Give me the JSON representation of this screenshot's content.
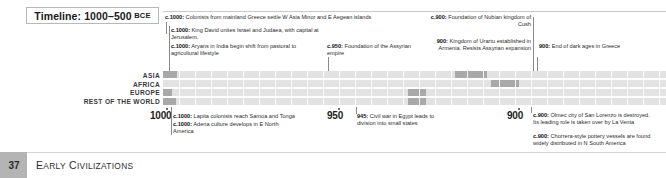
{
  "header": {
    "timeline_label": "Timeline: 1000–500",
    "timeline_era": "BCE"
  },
  "regions": [
    {
      "name": "asia",
      "label": "ASIA"
    },
    {
      "name": "africa",
      "label": "AFRICA"
    },
    {
      "name": "europe",
      "label": "EUROPE"
    },
    {
      "name": "rest-of-world",
      "label": "REST OF THE WORLD"
    }
  ],
  "axis": {
    "years": [
      "1000",
      "950",
      "900"
    ]
  },
  "events_above": [
    {
      "name": "greek-colonists-asia-minor",
      "year": "c.1000:",
      "text": " Colonists from mainland Greece settle W Asia Minor and E Aegean islands"
    },
    {
      "name": "king-david-israel-judaea",
      "year": "c.1000:",
      "text": " King David unites Israel and Judaea, with capital at Jerusalem."
    },
    {
      "name": "aryans-india-agriculture",
      "year": "c.1000:",
      "text": " Aryans in India begin shift from pastoral to agricultural lifestyle"
    },
    {
      "name": "foundation-assyrian-empire",
      "year": "c.950:",
      "text": " Foundation of the Assyrian empire"
    },
    {
      "name": "nubian-kingdom-of-cush",
      "year": "c.900:",
      "text": " Foundation of Nubian kingdom of Cush"
    },
    {
      "name": "kingdom-of-urartu",
      "year": "900:",
      "text": " Kingdom of Urartu established in Armenia. Resists Assyrian expansion"
    },
    {
      "name": "end-of-dark-ages-greece",
      "year": "900:",
      "text": " End of dark ages in Greece"
    }
  ],
  "events_below": [
    {
      "name": "lapita-colonists-samoa-tonga",
      "year": "c.1000:",
      "text": " Lapita colonists reach Samoa and Tonga"
    },
    {
      "name": "adena-culture-north-america",
      "year": "c.1000:",
      "text": " Adena culture develops in E North America"
    },
    {
      "name": "civil-war-egypt",
      "year": "945:",
      "text": " Civil war in Egypt leads to division into small states"
    },
    {
      "name": "olmec-san-lorenzo-destroyed",
      "year": "c.900:",
      "text": " Olmec city of San Lorenzo is destroyed. Its leading role is taken over by La Venta"
    },
    {
      "name": "chorrera-pottery-south-america",
      "year": "c.900:",
      "text": " Chorrera-style pottery vessels are found widely distributed in N South America"
    }
  ],
  "footer": {
    "page_number": "37",
    "section_title_parts": [
      {
        "big": "E",
        "small": "ARLY"
      },
      {
        "big": "C",
        "small": "IVILIZATIONS"
      }
    ]
  },
  "colors": {
    "band_background": "#e2e2e2",
    "band_segment": "#a9a9a9",
    "footer_block": "#b4b4b4",
    "text": "#2b2b2b"
  }
}
